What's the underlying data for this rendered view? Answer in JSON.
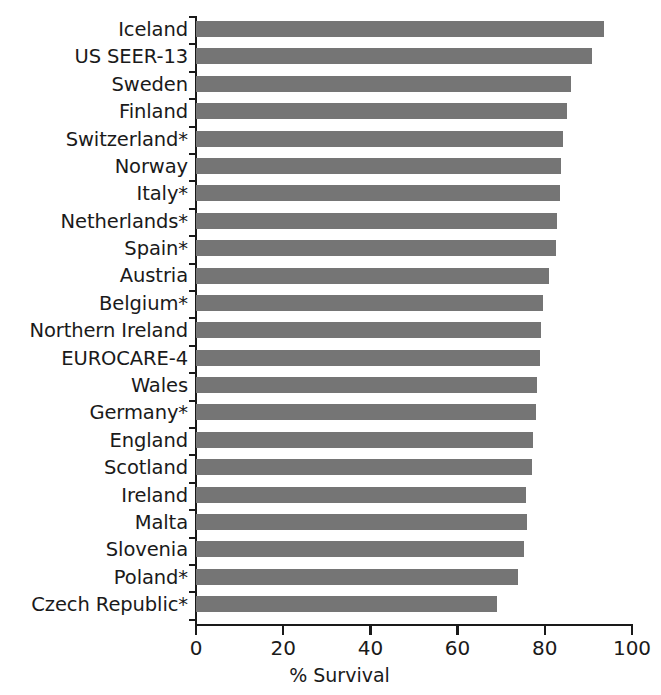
{
  "chart_data": {
    "type": "bar",
    "orientation": "horizontal",
    "title": "",
    "subtitle": "",
    "xlabel": "% Survival",
    "ylabel": "",
    "xlim": [
      0,
      100
    ],
    "xticks": [
      "0",
      "20",
      "40",
      "60",
      "80",
      "100"
    ],
    "xtick_values": [
      0,
      20,
      40,
      60,
      80,
      100
    ],
    "grid": false,
    "legend": null,
    "bar_color": "#757575",
    "axis_color": "#1a1a1a",
    "background_color": "#ffffff",
    "categories": [
      "Iceland",
      "US SEER-13",
      "Sweden",
      "Finland",
      "Switzerland*",
      "Norway",
      "Italy*",
      "Netherlands*",
      "Spain*",
      "Austria",
      "Belgium*",
      "Northern Ireland",
      "EUROCARE-4",
      "Wales",
      "Germany*",
      "England",
      "Scotland",
      "Ireland",
      "Malta",
      "Slovenia",
      "Poland*",
      "Czech Republic*"
    ],
    "values": [
      93.5,
      90.8,
      86.0,
      85.0,
      84.2,
      83.8,
      83.5,
      82.8,
      82.5,
      81.0,
      79.5,
      79.2,
      79.0,
      78.3,
      78.0,
      77.3,
      77.0,
      75.8,
      76.0,
      75.2,
      73.8,
      69.0
    ]
  }
}
